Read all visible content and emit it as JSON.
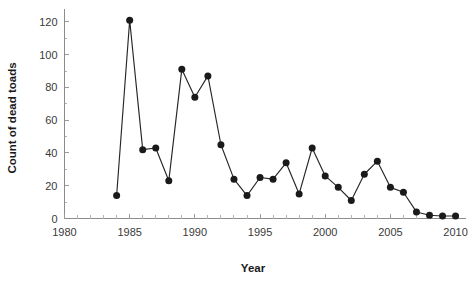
{
  "chart_data": {
    "type": "line",
    "title": "",
    "xlabel": "Year",
    "ylabel": "Count of dead toads",
    "xlim": [
      1980,
      2010.8
    ],
    "ylim": [
      0,
      126
    ],
    "xticks": [
      1980,
      1985,
      1990,
      1995,
      2000,
      2005,
      2010
    ],
    "xtick_labels": [
      "1980",
      "1985",
      "1990",
      "1995",
      "2000",
      "2005",
      "2010"
    ],
    "x_minor_tick_step": 1,
    "yticks": [
      0,
      20,
      40,
      60,
      80,
      100,
      120
    ],
    "ytick_labels": [
      "0",
      "20",
      "40",
      "60",
      "80",
      "100",
      "120"
    ],
    "grid": false,
    "legend": null,
    "marker": "filled-circle",
    "line_color": "#262626",
    "marker_color": "#1a1a1a",
    "x": [
      1984,
      1985,
      1986,
      1987,
      1988,
      1989,
      1990,
      1991,
      1992,
      1993,
      1994,
      1995,
      1996,
      1997,
      1998,
      1999,
      2000,
      2001,
      2002,
      2003,
      2004,
      2005,
      2006,
      2007,
      2008,
      2009,
      2010
    ],
    "values": [
      14,
      121,
      42,
      43,
      23,
      91,
      74,
      87,
      45,
      24,
      14,
      25,
      24,
      34,
      15,
      43,
      26,
      19,
      11,
      27,
      35,
      19,
      16,
      4,
      2,
      1.5,
      1.5
    ],
    "series": [
      {
        "name": "Count of dead toads",
        "points": [
          {
            "year": 1984,
            "count": 14
          },
          {
            "year": 1985,
            "count": 121
          },
          {
            "year": 1986,
            "count": 42
          },
          {
            "year": 1987,
            "count": 43
          },
          {
            "year": 1988,
            "count": 23
          },
          {
            "year": 1989,
            "count": 91
          },
          {
            "year": 1990,
            "count": 74
          },
          {
            "year": 1991,
            "count": 87
          },
          {
            "year": 1992,
            "count": 45
          },
          {
            "year": 1993,
            "count": 24
          },
          {
            "year": 1994,
            "count": 14
          },
          {
            "year": 1995,
            "count": 25
          },
          {
            "year": 1996,
            "count": 24
          },
          {
            "year": 1997,
            "count": 34
          },
          {
            "year": 1998,
            "count": 15
          },
          {
            "year": 1999,
            "count": 43
          },
          {
            "year": 2000,
            "count": 26
          },
          {
            "year": 2001,
            "count": 19
          },
          {
            "year": 2002,
            "count": 11
          },
          {
            "year": 2003,
            "count": 27
          },
          {
            "year": 2004,
            "count": 35
          },
          {
            "year": 2005,
            "count": 19
          },
          {
            "year": 2006,
            "count": 16
          },
          {
            "year": 2007,
            "count": 4
          },
          {
            "year": 2008,
            "count": 2
          },
          {
            "year": 2009,
            "count": 1.5
          },
          {
            "year": 2010,
            "count": 1.5
          }
        ]
      }
    ]
  }
}
